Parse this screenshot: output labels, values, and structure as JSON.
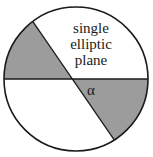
{
  "diagram": {
    "label_lines": [
      "single",
      "elliptic",
      "plane"
    ],
    "angle_label": "α",
    "colors": {
      "shaded": "#9c9c9c",
      "stroke": "#1a1a1a",
      "background": "#ffffff"
    }
  }
}
